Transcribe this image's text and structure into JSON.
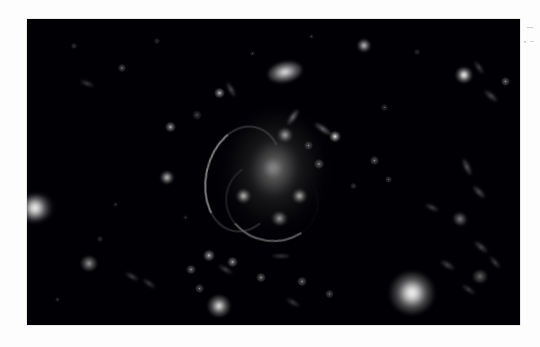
{
  "page": {
    "background_color": "#fdfdfd",
    "kind": "astronomical-image-figure"
  },
  "plate": {
    "x": 27,
    "y": 19,
    "width": 493,
    "height": 306,
    "sky_color": "#000005",
    "border_color": "#d8d8d8",
    "label": "galaxy-cluster-plate"
  },
  "margin_marks": [
    {
      "x": 527,
      "y": 27,
      "w": 6,
      "h": 1,
      "color": "#cccccc"
    },
    {
      "x": 530,
      "y": 41,
      "w": 4,
      "h": 1,
      "color": "#d2d2d2"
    },
    {
      "x": 524,
      "y": 41,
      "w": 2,
      "h": 2,
      "color": "#d0d0d0"
    }
  ],
  "chart_data": {
    "type": "scatter",
    "xlabel": "",
    "ylabel": "",
    "xlim": [
      0,
      493
    ],
    "ylim": [
      0,
      306
    ],
    "grid": false,
    "legend": "none",
    "annotations": [
      "Central cD galaxy at plate (246,149) is the brightest source",
      "Giant lensed arc curves along the west side of the cluster core",
      "A second lensed arc wraps the south of the cluster core"
    ],
    "objects": [
      {
        "id": "cd-galaxy-core",
        "type": "elliptical",
        "x": 246,
        "y": 149,
        "w": 20,
        "h": 20,
        "brightness": 1.0,
        "angle": 0
      },
      {
        "id": "cluster-halo",
        "type": "halo",
        "x": 247,
        "y": 152,
        "w": 108,
        "h": 124,
        "brightness": 0.3,
        "angle": 8
      },
      {
        "id": "bcg-companion-n",
        "type": "elliptical",
        "x": 258,
        "y": 116,
        "w": 16,
        "h": 14,
        "brightness": 0.72,
        "angle": 0
      },
      {
        "id": "bcg-companion-sw",
        "type": "elliptical",
        "x": 216,
        "y": 177,
        "w": 15,
        "h": 14,
        "brightness": 0.78,
        "angle": 0
      },
      {
        "id": "bcg-companion-se",
        "type": "elliptical",
        "x": 272,
        "y": 177,
        "w": 15,
        "h": 14,
        "brightness": 0.76,
        "angle": 0
      },
      {
        "id": "bcg-companion-e",
        "type": "elliptical",
        "x": 292,
        "y": 145,
        "w": 10,
        "h": 10,
        "brightness": 0.55,
        "angle": 0
      },
      {
        "id": "bcg-companion-ne",
        "type": "elliptical",
        "x": 281,
        "y": 126,
        "w": 9,
        "h": 9,
        "brightness": 0.5,
        "angle": 0
      },
      {
        "id": "south-knot",
        "type": "elliptical",
        "x": 252,
        "y": 199,
        "w": 17,
        "h": 13,
        "brightness": 0.7,
        "angle": 10
      },
      {
        "id": "arc-west-primary",
        "type": "lensed-arc",
        "x": 215,
        "y": 158,
        "w": 74,
        "h": 104,
        "brightness": 0.58,
        "angle": 12
      },
      {
        "id": "arc-south-secondary",
        "type": "lensed-arc",
        "x": 243,
        "y": 180,
        "w": 90,
        "h": 78,
        "brightness": 0.42,
        "angle": 8
      },
      {
        "id": "edge-on-ne-of-core",
        "type": "edge-on",
        "x": 266,
        "y": 98,
        "w": 18,
        "h": 6,
        "brightness": 0.6,
        "angle": -55
      },
      {
        "id": "edge-on-n-of-core",
        "type": "edge-on",
        "x": 296,
        "y": 110,
        "w": 20,
        "h": 6,
        "brightness": 0.58,
        "angle": 35
      },
      {
        "id": "star-ne-of-core",
        "type": "point",
        "x": 308,
        "y": 117,
        "w": 12,
        "h": 11,
        "brightness": 0.82,
        "angle": 0
      },
      {
        "id": "lenticular-top",
        "type": "lenticular",
        "x": 258,
        "y": 53,
        "w": 34,
        "h": 20,
        "brightness": 0.88,
        "angle": -12
      },
      {
        "id": "star-upper-center",
        "type": "point",
        "x": 192,
        "y": 74,
        "w": 11,
        "h": 10,
        "brightness": 0.72,
        "angle": 0
      },
      {
        "id": "edge-on-upper-center",
        "type": "edge-on",
        "x": 204,
        "y": 70,
        "w": 16,
        "h": 5,
        "brightness": 0.5,
        "angle": 60
      },
      {
        "id": "star-top-right",
        "type": "point",
        "x": 337,
        "y": 26,
        "w": 14,
        "h": 13,
        "brightness": 0.8,
        "angle": 0
      },
      {
        "id": "star-right-bright",
        "type": "point",
        "x": 437,
        "y": 56,
        "w": 18,
        "h": 16,
        "brightness": 0.92,
        "angle": 0
      },
      {
        "id": "edge-on-far-right-n",
        "type": "edge-on",
        "x": 452,
        "y": 48,
        "w": 14,
        "h": 5,
        "brightness": 0.45,
        "angle": 55
      },
      {
        "id": "edge-on-far-right-ne",
        "type": "edge-on",
        "x": 464,
        "y": 77,
        "w": 16,
        "h": 6,
        "brightness": 0.48,
        "angle": 40
      },
      {
        "id": "star-far-right-mid",
        "type": "point",
        "x": 478,
        "y": 62,
        "w": 9,
        "h": 9,
        "brightness": 0.55,
        "angle": 0
      },
      {
        "id": "edge-on-right-a",
        "type": "edge-on",
        "x": 440,
        "y": 148,
        "w": 18,
        "h": 6,
        "brightness": 0.52,
        "angle": 65
      },
      {
        "id": "edge-on-right-b",
        "type": "edge-on",
        "x": 452,
        "y": 173,
        "w": 16,
        "h": 6,
        "brightness": 0.5,
        "angle": 45
      },
      {
        "id": "galaxy-right-c",
        "type": "elliptical",
        "x": 433,
        "y": 200,
        "w": 16,
        "h": 12,
        "brightness": 0.62,
        "angle": 35
      },
      {
        "id": "edge-on-right-d",
        "type": "edge-on",
        "x": 405,
        "y": 188,
        "w": 14,
        "h": 5,
        "brightness": 0.46,
        "angle": 25
      },
      {
        "id": "edge-on-right-e",
        "type": "edge-on",
        "x": 454,
        "y": 228,
        "w": 16,
        "h": 6,
        "brightness": 0.48,
        "angle": 40
      },
      {
        "id": "edge-on-right-f",
        "type": "edge-on",
        "x": 468,
        "y": 243,
        "w": 14,
        "h": 5,
        "brightness": 0.44,
        "angle": 50
      },
      {
        "id": "edge-on-right-g",
        "type": "edge-on",
        "x": 420,
        "y": 246,
        "w": 15,
        "h": 6,
        "brightness": 0.46,
        "angle": 30
      },
      {
        "id": "edge-on-right-h",
        "type": "edge-on",
        "x": 441,
        "y": 270,
        "w": 15,
        "h": 5,
        "brightness": 0.42,
        "angle": 35
      },
      {
        "id": "galaxy-right-bottom",
        "type": "elliptical",
        "x": 453,
        "y": 257,
        "w": 16,
        "h": 13,
        "brightness": 0.55,
        "angle": 0
      },
      {
        "id": "big-elliptical-br",
        "type": "elliptical",
        "x": 385,
        "y": 274,
        "w": 46,
        "h": 42,
        "brightness": 0.95,
        "angle": 0
      },
      {
        "id": "bright-left-edge",
        "type": "elliptical",
        "x": 8,
        "y": 189,
        "w": 38,
        "h": 26,
        "brightness": 0.95,
        "angle": -8
      },
      {
        "id": "star-left-mid",
        "type": "point",
        "x": 140,
        "y": 158,
        "w": 14,
        "h": 13,
        "brightness": 0.8,
        "angle": 0
      },
      {
        "id": "star-left-upper",
        "type": "point",
        "x": 143,
        "y": 108,
        "w": 11,
        "h": 10,
        "brightness": 0.68,
        "angle": 0
      },
      {
        "id": "edge-on-left-upper",
        "type": "edge-on",
        "x": 60,
        "y": 64,
        "w": 14,
        "h": 5,
        "brightness": 0.42,
        "angle": 20
      },
      {
        "id": "star-upper-left-a",
        "type": "point",
        "x": 95,
        "y": 49,
        "w": 8,
        "h": 8,
        "brightness": 0.5,
        "angle": 0
      },
      {
        "id": "star-upper-left-b",
        "type": "point",
        "x": 47,
        "y": 27,
        "w": 6,
        "h": 6,
        "brightness": 0.38,
        "angle": 0
      },
      {
        "id": "star-upper-left-c",
        "type": "point",
        "x": 130,
        "y": 22,
        "w": 6,
        "h": 6,
        "brightness": 0.36,
        "angle": 0
      },
      {
        "id": "star-left-low",
        "type": "point",
        "x": 73,
        "y": 220,
        "w": 6,
        "h": 6,
        "brightness": 0.36,
        "angle": 0
      },
      {
        "id": "galaxy-bottom-left",
        "type": "elliptical",
        "x": 62,
        "y": 244,
        "w": 18,
        "h": 15,
        "brightness": 0.68,
        "angle": 0
      },
      {
        "id": "edge-on-bottom-left-a",
        "type": "edge-on",
        "x": 105,
        "y": 257,
        "w": 14,
        "h": 5,
        "brightness": 0.45,
        "angle": 30
      },
      {
        "id": "edge-on-bottom-left-b",
        "type": "edge-on",
        "x": 122,
        "y": 264,
        "w": 14,
        "h": 5,
        "brightness": 0.42,
        "angle": 35
      },
      {
        "id": "edge-on-bottom-left-c",
        "type": "edge-on",
        "x": 198,
        "y": 250,
        "w": 15,
        "h": 5,
        "brightness": 0.44,
        "angle": 30
      },
      {
        "id": "star-bottom-center-a",
        "type": "point",
        "x": 182,
        "y": 236,
        "w": 12,
        "h": 11,
        "brightness": 0.7,
        "angle": 0
      },
      {
        "id": "star-bottom-center-b",
        "type": "point",
        "x": 205,
        "y": 243,
        "w": 11,
        "h": 10,
        "brightness": 0.65,
        "angle": 0
      },
      {
        "id": "star-bottom-center-c",
        "type": "point",
        "x": 164,
        "y": 250,
        "w": 10,
        "h": 9,
        "brightness": 0.58,
        "angle": 0
      },
      {
        "id": "galaxy-bottom-center",
        "type": "elliptical",
        "x": 192,
        "y": 287,
        "w": 24,
        "h": 22,
        "brightness": 0.85,
        "angle": 0
      },
      {
        "id": "star-bottom-center-d",
        "type": "point",
        "x": 172,
        "y": 269,
        "w": 9,
        "h": 9,
        "brightness": 0.52,
        "angle": 0
      },
      {
        "id": "star-bottom-center-e",
        "type": "point",
        "x": 234,
        "y": 258,
        "w": 10,
        "h": 9,
        "brightness": 0.58,
        "angle": 0
      },
      {
        "id": "edge-on-bottom-mid",
        "type": "edge-on",
        "x": 254,
        "y": 237,
        "w": 18,
        "h": 4,
        "brightness": 0.44,
        "angle": 0
      },
      {
        "id": "star-bottom-right-a",
        "type": "point",
        "x": 275,
        "y": 262,
        "w": 10,
        "h": 9,
        "brightness": 0.55,
        "angle": 0
      },
      {
        "id": "edge-on-bottom-right",
        "type": "edge-on",
        "x": 266,
        "y": 283,
        "w": 14,
        "h": 5,
        "brightness": 0.42,
        "angle": 30
      },
      {
        "id": "star-bottom-far-right",
        "type": "point",
        "x": 302,
        "y": 275,
        "w": 9,
        "h": 8,
        "brightness": 0.48,
        "angle": 0
      },
      {
        "id": "star-center-right",
        "type": "point",
        "x": 347,
        "y": 141,
        "w": 9,
        "h": 9,
        "brightness": 0.52,
        "angle": 0
      },
      {
        "id": "star-center-right-b",
        "type": "point",
        "x": 361,
        "y": 160,
        "w": 7,
        "h": 7,
        "brightness": 0.4,
        "angle": 0
      },
      {
        "id": "star-mid-right",
        "type": "point",
        "x": 326,
        "y": 167,
        "w": 7,
        "h": 6,
        "brightness": 0.36,
        "angle": 0
      },
      {
        "id": "star-upper-mid-right",
        "type": "point",
        "x": 357,
        "y": 88,
        "w": 7,
        "h": 7,
        "brightness": 0.38,
        "angle": 0
      },
      {
        "id": "star-faint-top-a",
        "type": "point",
        "x": 225,
        "y": 34,
        "w": 5,
        "h": 5,
        "brightness": 0.3,
        "angle": 0
      },
      {
        "id": "star-faint-top-b",
        "type": "point",
        "x": 284,
        "y": 17,
        "w": 5,
        "h": 5,
        "brightness": 0.28,
        "angle": 0
      },
      {
        "id": "star-faint-right-top",
        "type": "point",
        "x": 390,
        "y": 33,
        "w": 6,
        "h": 6,
        "brightness": 0.34,
        "angle": 0
      },
      {
        "id": "star-faint-left-low",
        "type": "point",
        "x": 30,
        "y": 280,
        "w": 5,
        "h": 5,
        "brightness": 0.28,
        "angle": 0
      },
      {
        "id": "star-faint-mid-left",
        "type": "point",
        "x": 88,
        "y": 185,
        "w": 5,
        "h": 5,
        "brightness": 0.26,
        "angle": 0
      },
      {
        "id": "star-faint-center",
        "type": "point",
        "x": 158,
        "y": 198,
        "w": 5,
        "h": 5,
        "brightness": 0.26,
        "angle": 0
      },
      {
        "id": "galaxy-left-mid-faint",
        "type": "elliptical",
        "x": 170,
        "y": 96,
        "w": 10,
        "h": 8,
        "brightness": 0.4,
        "angle": 20
      }
    ]
  }
}
